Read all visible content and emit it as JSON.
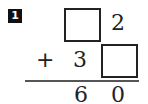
{
  "problem": {
    "number": "1",
    "operator": "+",
    "top_row": {
      "tens": {
        "type": "blank-box",
        "value": ""
      },
      "ones": "2"
    },
    "second_row": {
      "tens": "3",
      "ones": {
        "type": "blank-box",
        "value": ""
      }
    },
    "result": {
      "tens": "6",
      "ones": "0"
    }
  },
  "colors": {
    "badge_bg": "#111111",
    "badge_text": "#ffffff",
    "text": "#222222",
    "rule": "#555555"
  }
}
